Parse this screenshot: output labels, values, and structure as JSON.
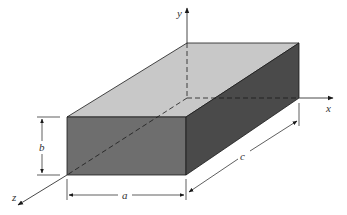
{
  "figure": {
    "axes": {
      "x": "x",
      "y": "y",
      "z": "z"
    },
    "dimensions": {
      "a": "a",
      "b": "b",
      "c": "c"
    },
    "colors": {
      "top_face": "#c8c8c8",
      "front_face": "#6e6e6e",
      "side_face": "#4a4a4a",
      "lines": "#1a1a1a"
    }
  }
}
